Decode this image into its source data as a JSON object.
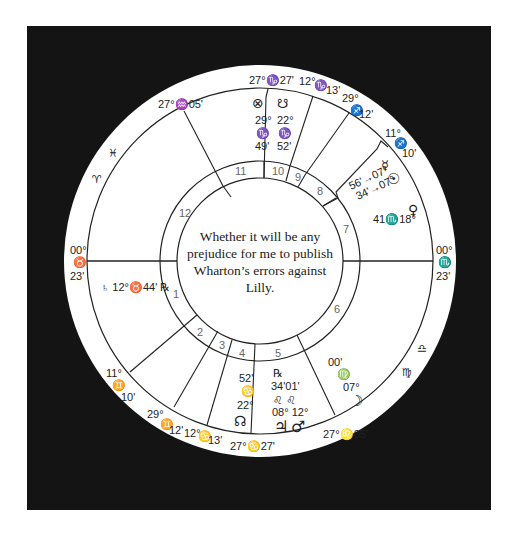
{
  "chart": {
    "type": "horary-wheel",
    "question": "Whether it will be any prejudice for me to publish Wharton’s errors against Lilly.",
    "colors": {
      "frame": "#141414",
      "wheel": "#ffffff",
      "lines": "#222222",
      "house_numbers": "#666666"
    }
  },
  "house_numbers": [
    "1",
    "2",
    "3",
    "4",
    "5",
    "6",
    "7",
    "8",
    "9",
    "10",
    "11",
    "12"
  ],
  "cusps": [
    {
      "house": 1,
      "label_deg": "00°",
      "sign": "♉",
      "label_min": "23'"
    },
    {
      "house": 2,
      "label_deg": "11°",
      "sign": "♊",
      "label_min": "10'"
    },
    {
      "house": 3,
      "label_deg": "29°",
      "sign": "♊",
      "label_min": "12'"
    },
    {
      "house": "3b",
      "label_deg": "12°",
      "sign": "♋",
      "label_min": "13'"
    },
    {
      "house": 4,
      "label_deg": "27°",
      "sign": "♋",
      "label_min": "27'"
    },
    {
      "house": 5,
      "label_deg": "27°",
      "sign": "♌",
      "label_min": "05'"
    },
    {
      "house": 7,
      "label_deg": "00°",
      "sign": "♏",
      "label_min": "23'"
    },
    {
      "house": 8,
      "label_deg": "11°",
      "sign": "♐",
      "label_min": "10'"
    },
    {
      "house": 9,
      "label_deg": "29°",
      "sign": "♐",
      "label_min": "12'"
    },
    {
      "house": "9b",
      "label_deg": "12°",
      "sign": "♑",
      "label_min": "13'"
    },
    {
      "house": 10,
      "label_deg": "27°",
      "sign": "♑",
      "label_min": "27'"
    },
    {
      "house": 11,
      "label_deg": "27°",
      "sign": "♒",
      "label_min": "05'"
    }
  ],
  "intercepted_signs": [
    {
      "sign": "♓",
      "name": "Pisces"
    },
    {
      "sign": "♈",
      "name": "Aries"
    },
    {
      "sign": "♎",
      "name": "Libra"
    },
    {
      "sign": "♍",
      "name": "Virgo"
    }
  ],
  "planets": [
    {
      "name": "Part of Fortune",
      "glyph": "⊗",
      "deg": "29°",
      "sign": "♑",
      "min": "49'",
      "house": 10
    },
    {
      "name": "South Node",
      "glyph": "☋",
      "deg": "22°",
      "sign": "♑",
      "min": "52'",
      "house": 10
    },
    {
      "name": "Mercury",
      "glyph": "☿",
      "text": "56'♐07°",
      "house": 8
    },
    {
      "name": "Sun",
      "glyph": "☉",
      "text": "34'♐07°",
      "house": 8
    },
    {
      "name": "Venus",
      "glyph": "♀",
      "text": "41♏18°",
      "house": 7
    },
    {
      "name": "Saturn",
      "glyph": "♄",
      "text": "12°♉44' ℞",
      "house": 1
    },
    {
      "name": "Moon",
      "glyph": "☽",
      "deg": "07°",
      "sign": "♍",
      "min": "00'",
      "house": 5
    },
    {
      "name": "Jupiter",
      "glyph": "♃",
      "deg": "08°",
      "sign": "♌",
      "min": "01'",
      "retro": "℞",
      "house": 5
    },
    {
      "name": "Mars",
      "glyph": "♂",
      "deg": "12°",
      "sign": "♌",
      "min": "34'",
      "house": 5
    },
    {
      "name": "North Node",
      "glyph": "☊",
      "deg": "22°",
      "sign": "♋",
      "min": "52'",
      "house": 4
    }
  ],
  "labels": {
    "asc_deg": "00°",
    "asc_sign": "♉",
    "asc_min": "23'",
    "dsc_deg": "00°",
    "dsc_sign": "♏",
    "dsc_min": "23'",
    "mc": "27°♑27'",
    "ic": "27°♋27'",
    "c11": "27°♒05'",
    "c5": "27°♌05'",
    "c9b_a": "12°",
    "c9b_s": "♑",
    "c9b_m": "13'",
    "c9_a": "29°",
    "c9_s": "♐",
    "c9_m": "12'",
    "c8_a": "11°",
    "c8_s": "♐",
    "c8_m": "10'",
    "c2_a": "11°",
    "c2_s": "♊",
    "c2_m": "10'",
    "c3_a": "29°",
    "c3_s": "♊",
    "c3_m": "12'",
    "c3b_a": "12°",
    "c3b_s": "♋",
    "c3b_m": "13'",
    "pisces": "♓",
    "aries": "♈",
    "libra": "♎",
    "virgo": "♍",
    "pof_g": "⊗",
    "pof_d": "29°",
    "pof_s": "♑",
    "pof_m": "49'",
    "sn_g": "☋",
    "sn_d": "22°",
    "sn_s": "♑",
    "sn_m": "52'",
    "mer_g": "☿",
    "mer_t": "56'→07°",
    "sun_g": "☉",
    "sun_t": "34'→07°",
    "ven_g": "♀",
    "ven_t": "41♏18°",
    "sat_t": "♄ 12°♉44' ℞",
    "moon_m": "00'",
    "moon_s": "♍",
    "moon_d": "07°",
    "moon_g": "☽",
    "jup_r": "℞",
    "jm_m": "34'01'",
    "jm_s": "♌ ♌",
    "jm_d": "08° 12°",
    "jup_g": "♃",
    "mars_g": "♂",
    "nn_m": "52'",
    "nn_s": "♋",
    "nn_d": "22°",
    "nn_g": "☊"
  }
}
